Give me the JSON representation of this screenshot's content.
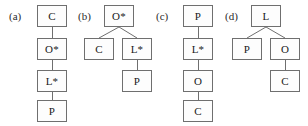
{
  "figure": {
    "type": "tree-diagram-set",
    "panel_count": 4,
    "node_colors": {
      "border": "#6f6f6f",
      "fill": "#fdfdfd",
      "text": "#1a1a1a",
      "edge": "#6f6f6f",
      "background": "#ffffff"
    }
  },
  "panels": [
    {
      "id": "a",
      "label": "(a)",
      "layout": "chain",
      "nodes": [
        {
          "id": "a1",
          "label": "C",
          "level": 0,
          "x": 37,
          "y": 5
        },
        {
          "id": "a2",
          "label": "O*",
          "level": 1,
          "x": 37,
          "y": 38
        },
        {
          "id": "a3",
          "label": "L*",
          "level": 2,
          "x": 37,
          "y": 70
        },
        {
          "id": "a4",
          "label": "P",
          "level": 3,
          "x": 37,
          "y": 100
        }
      ],
      "edges": [
        {
          "from": "a1",
          "to": "a2"
        },
        {
          "from": "a2",
          "to": "a3"
        },
        {
          "from": "a3",
          "to": "a4"
        }
      ]
    },
    {
      "id": "b",
      "label": "(b)",
      "layout": "branching",
      "nodes": [
        {
          "id": "b1",
          "label": "O*",
          "level": 0,
          "x": 104,
          "y": 5
        },
        {
          "id": "b2",
          "label": "C",
          "level": 1,
          "x": 84,
          "y": 38
        },
        {
          "id": "b3",
          "label": "L*",
          "level": 1,
          "x": 122,
          "y": 38
        },
        {
          "id": "b4",
          "label": "P",
          "level": 2,
          "x": 122,
          "y": 70
        }
      ],
      "edges": [
        {
          "from": "b1",
          "to": "b2"
        },
        {
          "from": "b1",
          "to": "b3"
        },
        {
          "from": "b3",
          "to": "b4"
        }
      ]
    },
    {
      "id": "c",
      "label": "(c)",
      "layout": "chain",
      "nodes": [
        {
          "id": "c1",
          "label": "P",
          "level": 0,
          "x": 183,
          "y": 5
        },
        {
          "id": "c2",
          "label": "L*",
          "level": 1,
          "x": 183,
          "y": 38
        },
        {
          "id": "c3",
          "label": "O",
          "level": 2,
          "x": 183,
          "y": 70
        },
        {
          "id": "c4",
          "label": "C",
          "level": 3,
          "x": 183,
          "y": 100
        }
      ],
      "edges": [
        {
          "from": "c1",
          "to": "c2"
        },
        {
          "from": "c2",
          "to": "c3"
        },
        {
          "from": "c3",
          "to": "c4"
        }
      ]
    },
    {
      "id": "d",
      "label": "(d)",
      "layout": "branching",
      "nodes": [
        {
          "id": "d1",
          "label": "L",
          "level": 0,
          "x": 251,
          "y": 5
        },
        {
          "id": "d2",
          "label": "P",
          "level": 1,
          "x": 232,
          "y": 38
        },
        {
          "id": "d3",
          "label": "O",
          "level": 1,
          "x": 270,
          "y": 38
        },
        {
          "id": "d4",
          "label": "C",
          "level": 2,
          "x": 270,
          "y": 70
        }
      ],
      "edges": [
        {
          "from": "d1",
          "to": "d2"
        },
        {
          "from": "d1",
          "to": "d3"
        },
        {
          "from": "d3",
          "to": "d4"
        }
      ]
    }
  ],
  "panel_labels": {
    "a": "(a)",
    "b": "(b)",
    "c": "(c)",
    "d": "(d)"
  },
  "label_positions": {
    "a": {
      "x": 9,
      "y": 11
    },
    "b": {
      "x": 78,
      "y": 11
    },
    "c": {
      "x": 156,
      "y": 11
    },
    "d": {
      "x": 225,
      "y": 11
    }
  }
}
